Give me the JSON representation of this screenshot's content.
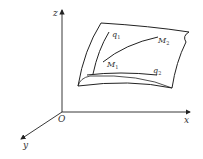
{
  "diagram": {
    "axes": {
      "origin_label": "O",
      "x_label": "x",
      "y_label": "y",
      "z_label": "z"
    },
    "surface": {
      "curve_q1": {
        "name": "q",
        "sub": "1"
      },
      "curve_q2": {
        "name": "q",
        "sub": "2"
      },
      "point_M1": {
        "name": "M",
        "sub": "1"
      },
      "point_M2": {
        "name": "M",
        "sub": "2"
      }
    },
    "colors": {
      "line": "#222222",
      "text": "#333333",
      "background": "#ffffff"
    }
  }
}
